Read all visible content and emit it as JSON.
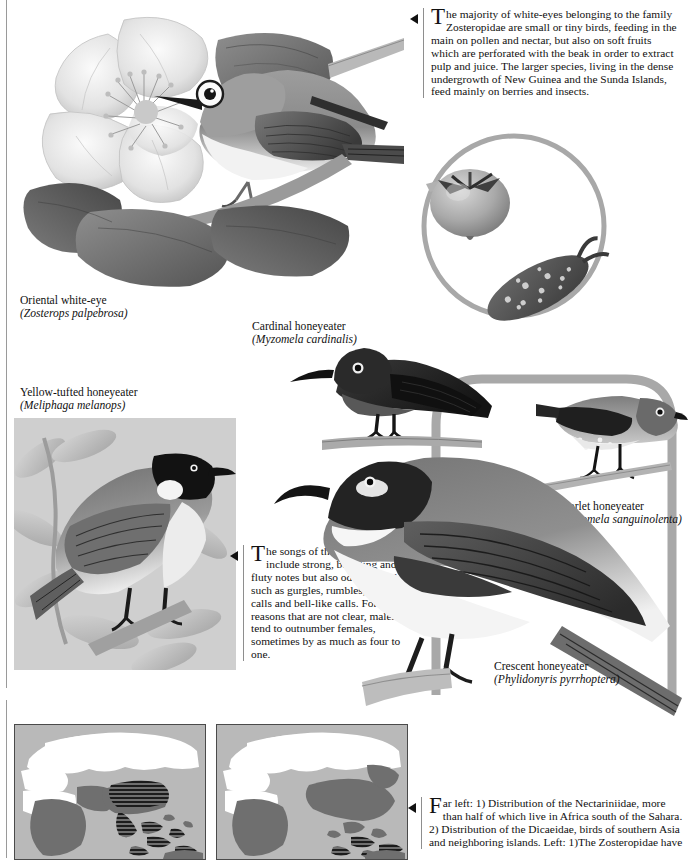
{
  "page": {
    "width": 688,
    "height": 858,
    "background": "#ffffff",
    "ink": "#111111",
    "rule_color": "#9a9a9a"
  },
  "text_blocks": [
    {
      "id": "white-eyes-intro",
      "dropcap": "T",
      "body": "he majority of white-eyes belonging to the family Zosteropidae are small or tiny birds, feeding in the main on pollen and nectar, but also on soft fruits which are perforated with the beak in order to extract pulp and juice. The larger species, living in the dense undergrowth of New Guinea and the Sunda Islands, feed mainly on berries and insects."
    },
    {
      "id": "honeyeater-songs",
      "dropcap": "T",
      "body": "he songs of the honeyeaters include strong, bubbling and fluty notes but also odder sounds such as gurgles, rumbles, trumpet-calls and bell-like calls. For reasons that are not clear, males tend to outnumber females, sometimes by as much as four to one."
    },
    {
      "id": "distribution-maps-caption",
      "dropcap": "F",
      "body": "ar left: 1) Distribution of the Nectariniidae, more than half of which live in Africa south of the Sahara. 2) Distribution of the Dicaeidae, birds of southern Asia and neighboring islands. Left: 1)The Zosteropidae have"
    }
  ],
  "captions": [
    {
      "id": "oriental-white-eye",
      "common": "Oriental white-eye",
      "latin": "(Zosterops palpebrosa)"
    },
    {
      "id": "yellow-tufted-honeyeater",
      "common": "Yellow-tufted honeyeater",
      "latin": "(Meliphaga melanops)"
    },
    {
      "id": "cardinal-honeyeater",
      "common": "Cardinal honeyeater",
      "latin": "(Myzomela cardinalis)"
    },
    {
      "id": "scarlet-honeyeater",
      "common": "Scarlet honeyeater",
      "latin": "(Myzomela sanguinolenta)"
    },
    {
      "id": "crescent-honeyeater",
      "common": "Crescent honeyeater",
      "latin": "(Phylidonyris pyrrhoptera)"
    }
  ],
  "illustrations": [
    {
      "id": "oriental-white-eye-plate",
      "subject": "Oriental white-eye perched on branch beside a large open pale flower with dark leaves",
      "style": "grayscale-engraving"
    },
    {
      "id": "fruit-inset",
      "subject": "Circular inset showing a round berry with calyx and a speckled elongated fruit",
      "style": "grayscale-engraving"
    },
    {
      "id": "yellow-tufted-plate",
      "subject": "Yellow-tufted honeyeater perched on a twig among foliage",
      "style": "grayscale-engraving"
    },
    {
      "id": "cardinal-honeyeater-plate",
      "subject": "Cardinal honeyeater, dark plumage, perched on a bare branch",
      "style": "grayscale-engraving"
    },
    {
      "id": "scarlet-honeyeater-plate",
      "subject": "Scarlet honeyeater perched on a thin twig",
      "style": "grayscale-engraving"
    },
    {
      "id": "crescent-honeyeater-plate",
      "subject": "Large crescent honeyeater perched on a branch, long decurved bill",
      "style": "grayscale-engraving"
    }
  ],
  "maps": [
    {
      "id": "map-nectariniidae",
      "label": "1",
      "description": "World map, Old World centered: distribution shaded across Africa and southern Asia with hatched range over the Indian subcontinent and Indonesia",
      "ocean_color": "#b9b9b9",
      "land_color": "#ffffff",
      "range_color": "#6f6f6f",
      "hatch_color": "#1c1c1c"
    },
    {
      "id": "map-dicaeidae",
      "label": "2",
      "description": "World map, Old World centered: distribution shaded across Africa, southern and eastern Asia with hatched islands through Indonesia and the Philippines",
      "ocean_color": "#b9b9b9",
      "land_color": "#ffffff",
      "range_color": "#6f6f6f",
      "hatch_color": "#1c1c1c"
    }
  ],
  "decor": {
    "frame_color": "#a8a8a8",
    "inset_circle_color": "#a8a8a8"
  }
}
